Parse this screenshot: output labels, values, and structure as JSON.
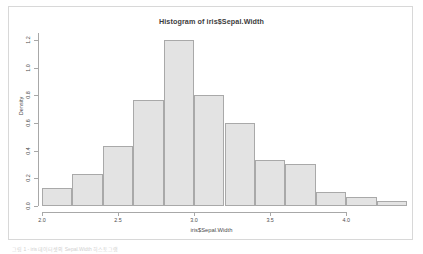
{
  "figure": {
    "title": "Histogram of iris$Sepal.Width",
    "caption": "그림 1 - iris 데이터셋의 Sepal.Width 히스토그램"
  },
  "axes": {
    "x_title": "iris$Sepal.Width",
    "y_title": "Density",
    "x_tick_labels": [
      "2.0",
      "2.5",
      "3.0",
      "3.5",
      "4.0"
    ],
    "y_tick_labels": [
      "0.0",
      "0.2",
      "0.4",
      "0.6",
      "0.8",
      "1.0",
      "1.2"
    ]
  },
  "style": {
    "bar_fill": "#e3e3e3",
    "bar_border": "#a9a9a9",
    "axis_color": "#a8a8a8",
    "text_color": "#4d4d4d",
    "frame_color": "#d8d8d8",
    "background": "#ffffff"
  },
  "chart_data": {
    "type": "bar",
    "title": "Histogram of iris$Sepal.Width",
    "xlabel": "iris$Sepal.Width",
    "ylabel": "Density",
    "xlim": [
      2.0,
      4.4
    ],
    "ylim": [
      0.0,
      1.25
    ],
    "grid": false,
    "legend": null,
    "bin_width": 0.2,
    "bin_edges": [
      2.0,
      2.2,
      2.4,
      2.6,
      2.8,
      3.0,
      3.2,
      3.4,
      3.6,
      3.8,
      4.0,
      4.2,
      4.4
    ],
    "categories": [
      "2.0-2.2",
      "2.2-2.4",
      "2.4-2.6",
      "2.6-2.8",
      "2.8-3.0",
      "3.0-3.2",
      "3.2-3.4",
      "3.4-3.6",
      "3.6-3.8",
      "3.8-4.0",
      "4.0-4.2",
      "4.2-4.4"
    ],
    "values": [
      0.133,
      0.233,
      0.433,
      0.767,
      1.2,
      0.8,
      0.6,
      0.333,
      0.3,
      0.1,
      0.067,
      0.033
    ],
    "x_ticks": [
      2.0,
      2.5,
      3.0,
      3.5,
      4.0
    ],
    "y_ticks": [
      0.0,
      0.2,
      0.4,
      0.6,
      0.8,
      1.0,
      1.2
    ]
  }
}
